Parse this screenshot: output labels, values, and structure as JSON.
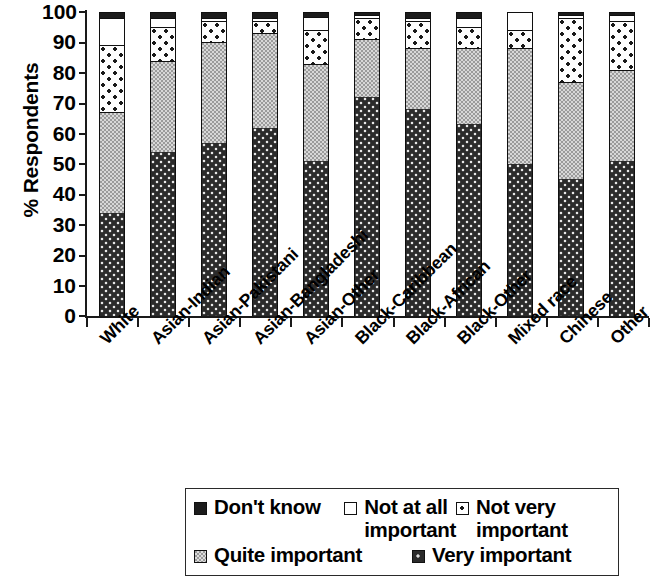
{
  "chart_data": {
    "type": "bar",
    "subtype": "stacked-percent",
    "title": "",
    "xlabel": "",
    "ylabel": "% Respondents",
    "ylim": [
      0,
      100
    ],
    "yticks": [
      0,
      10,
      20,
      30,
      40,
      50,
      60,
      70,
      80,
      90,
      100
    ],
    "grid": false,
    "legend_position": "bottom",
    "categories": [
      "White",
      "Asian-Indian",
      "Asian-Pakistani",
      "Asian-Bangladeshi",
      "Asian-Other",
      "Black-Caribbean",
      "Black-African",
      "Black-Other",
      "Mixed race",
      "Chinese",
      "Other"
    ],
    "series": [
      {
        "name": "Very important",
        "key": "very",
        "color": "#2b2b2b",
        "pattern": "dark-dots",
        "values": [
          34,
          54,
          57,
          62,
          51,
          72,
          68,
          63,
          50,
          45,
          51
        ]
      },
      {
        "name": "Quite important",
        "key": "quite",
        "color": "#9b9b9b",
        "pattern": "grey-checker",
        "values": [
          33,
          30,
          33,
          31,
          32,
          19,
          20,
          25,
          38,
          32,
          30
        ]
      },
      {
        "name": "Not very important",
        "key": "notvery",
        "color": "#fdfdfd",
        "pattern": "sparse-dots",
        "values": [
          22,
          11,
          7,
          4,
          11,
          7,
          9,
          7,
          6,
          21,
          16
        ]
      },
      {
        "name": "Not at all important",
        "key": "notatall",
        "color": "#ffffff",
        "pattern": "solid-white",
        "values": [
          9,
          3,
          1,
          1,
          4.5,
          1,
          1,
          3,
          6,
          1,
          2
        ]
      },
      {
        "name": "Don't know",
        "key": "dontknow",
        "color": "#1c1c1c",
        "pattern": "solid-black",
        "values": [
          2,
          2,
          2,
          2,
          1.5,
          1,
          2,
          2,
          0,
          1,
          1
        ]
      }
    ]
  },
  "axis": {
    "y_title": "% Respondents",
    "y_tick_labels": [
      "100",
      "90",
      "80",
      "70",
      "60",
      "50",
      "40",
      "30",
      "20",
      "10",
      "0"
    ]
  },
  "legend": {
    "items": [
      {
        "label": "Don't know",
        "swatch": "dontknow"
      },
      {
        "label": "Not at all important",
        "swatch": "notatall"
      },
      {
        "label": "Not very important",
        "swatch": "notvery"
      },
      {
        "label": "Quite important",
        "swatch": "quite"
      },
      {
        "label": "Very important",
        "swatch": "very"
      }
    ]
  }
}
